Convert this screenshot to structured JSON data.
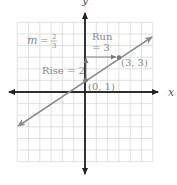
{
  "chart_data": {
    "type": "line",
    "title": "",
    "xlabel": "x",
    "ylabel": "y",
    "xlim": [
      -6,
      6
    ],
    "ylim": [
      -6,
      6
    ],
    "grid": true,
    "grid_step": 1,
    "line": {
      "equation": "y = (2/3)x + 1",
      "slope": "2/3",
      "y_intercept": 1,
      "extends_both_directions": true
    },
    "points": [
      {
        "x": 0,
        "y": 1,
        "label": "(0, 1)"
      },
      {
        "x": 3,
        "y": 3,
        "label": "(3, 3)"
      }
    ],
    "annotations": {
      "slope_label": {
        "var": "m",
        "eq": "=",
        "numerator": "2",
        "denominator": "3"
      },
      "run_label_line1": "Run",
      "run_label_line2": "= 3",
      "rise_label": "Rise = 2"
    }
  },
  "colors": {
    "grid": "#d9d9d9",
    "axis": "#222222",
    "line": "#8c8c8c",
    "point": "#7a7a7a",
    "text": "#8a8a8a"
  }
}
